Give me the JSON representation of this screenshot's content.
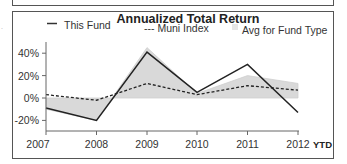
{
  "chart_data": {
    "type": "line",
    "title": "Annualized Total Return",
    "xlabel": "",
    "ylabel": "",
    "categories": [
      "2007",
      "2008",
      "2009",
      "2010",
      "2011",
      "2012"
    ],
    "x_suffix_label": "YTD",
    "y_ticks": [
      "40%",
      "20%",
      "0%",
      "-20%"
    ],
    "ylim": [
      -28,
      50
    ],
    "grid": false,
    "legend_position": "top",
    "series": [
      {
        "name": "This Fund",
        "style": "solid",
        "color": "#222222",
        "values": [
          -9,
          -20,
          41,
          5,
          30,
          -13
        ]
      },
      {
        "name": "Muni Index",
        "style": "dashed",
        "color": "#222222",
        "values": [
          3,
          -2,
          13,
          3,
          11,
          7
        ]
      },
      {
        "name": "Avg for Fund Type",
        "style": "area",
        "color": "#d9d9d9",
        "values": [
          -10,
          -20,
          45,
          4,
          20,
          13
        ]
      }
    ]
  },
  "legend": {
    "fund": "This Fund",
    "index": "--- Muni Index",
    "avg": "Avg for Fund Type"
  },
  "axis": {
    "y": [
      "40%",
      "20%",
      "0%",
      "-20%"
    ],
    "x": [
      "2007",
      "2008",
      "2009",
      "2010",
      "2011",
      "2012"
    ],
    "ytd": "YTD"
  }
}
